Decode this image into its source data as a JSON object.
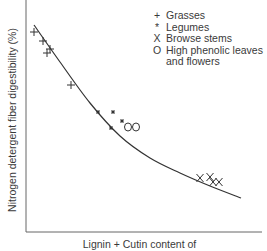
{
  "chart_data": {
    "type": "scatter",
    "title": "",
    "xlabel": "Lignin + Cutin content of",
    "ylabel": "Nitrogen detergent fiber digestibility (%)",
    "grid": false,
    "legend_position": "upper-right",
    "axis_ticks": "none",
    "series": [
      {
        "name": "Grasses",
        "marker": "+",
        "points_px": [
          [
            34,
            32
          ],
          [
            43,
            41
          ],
          [
            47,
            53
          ],
          [
            50,
            49
          ],
          [
            71,
            85
          ]
        ]
      },
      {
        "name": "Legumes",
        "marker": "*",
        "points_px": [
          [
            98,
            112
          ],
          [
            113,
            112
          ],
          [
            122,
            121
          ],
          [
            111,
            128
          ]
        ]
      },
      {
        "name": "Browse stems",
        "marker": "X",
        "points_px": [
          [
            200,
            178
          ],
          [
            210,
            177
          ],
          [
            213,
            182
          ],
          [
            219,
            182
          ]
        ]
      },
      {
        "name": "High phenolic leaves and flowers",
        "marker": "O",
        "points_px": [
          [
            128,
            127
          ],
          [
            136,
            127
          ]
        ]
      }
    ],
    "fit_curve": {
      "description": "decreasing convex curve",
      "points_px": [
        [
          34,
          25
        ],
        [
          60,
          62
        ],
        [
          90,
          103
        ],
        [
          120,
          136
        ],
        [
          150,
          158
        ],
        [
          180,
          173
        ],
        [
          210,
          186
        ],
        [
          241,
          198
        ]
      ]
    }
  },
  "legend": {
    "items": [
      {
        "symbol": "+",
        "label": "Grasses"
      },
      {
        "symbol": "*",
        "label": "Legumes"
      },
      {
        "symbol": "X",
        "label": "Browse stems"
      },
      {
        "symbol": "O",
        "label": "High phenolic leaves\nand flowers"
      }
    ]
  },
  "axes": {
    "x_label": "Lignin + Cutin content of",
    "y_label": "Nitrogen detergent fiber digestibility (%)"
  },
  "colors": {
    "ink": "#333333",
    "axis": "#555555",
    "background": "#ffffff"
  }
}
